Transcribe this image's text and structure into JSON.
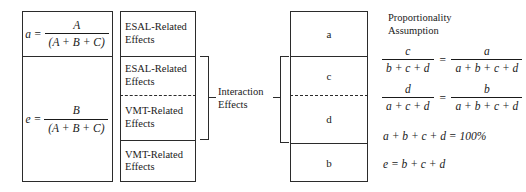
{
  "column1": {
    "cells": [
      {
        "lhs": "a =",
        "numerator": "A",
        "denominator": "(A + B + C)"
      },
      {
        "lhs": "e =",
        "numerator": "B",
        "denominator": "(A + B + C)"
      }
    ]
  },
  "column2": {
    "cells": [
      {
        "line1": "ESAL-Related",
        "line2": "Effects"
      },
      {
        "line1": "ESAL-Related",
        "line2": "Effects"
      },
      {
        "line1": "VMT-Related",
        "line2": "Effects"
      },
      {
        "line1": "VMT-Related",
        "line2": "Effects"
      }
    ],
    "bracket_label": {
      "line1": "Interaction",
      "line2": "Effects"
    }
  },
  "column3": {
    "cells": [
      {
        "label": "a"
      },
      {
        "label": "c"
      },
      {
        "label": "d"
      },
      {
        "label": "b"
      }
    ]
  },
  "column4": {
    "heading": {
      "line1": "Proportionality",
      "line2": "Assumption"
    },
    "equation1": {
      "left_numerator": "c",
      "left_denominator": "b + c + d",
      "operator": "=",
      "right_numerator": "a",
      "right_denominator": "a + b + c + d"
    },
    "equation2": {
      "left_numerator": "d",
      "left_denominator": "a + c + d",
      "operator": "=",
      "right_numerator": "b",
      "right_denominator": "a + b + c + d"
    },
    "equation3": "a + b + c + d = 100%",
    "equation4": "e = b + c + d"
  },
  "colors": {
    "stroke": "#2b2b2b",
    "text": "#1a1a1a",
    "background": "#ffffff"
  }
}
